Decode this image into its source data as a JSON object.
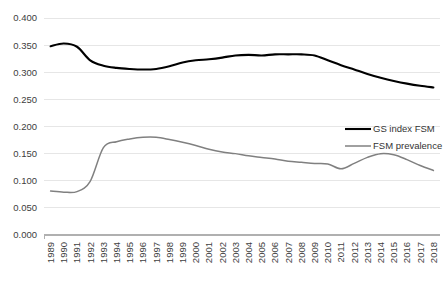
{
  "chart_data": {
    "type": "line",
    "title": "",
    "xlabel": "",
    "ylabel": "",
    "ylim": [
      0.0,
      0.4
    ],
    "ytick_labels": [
      "0.000",
      "0.050",
      "0.100",
      "0.150",
      "0.200",
      "0.250",
      "0.300",
      "0.350",
      "0.400"
    ],
    "ytick_values": [
      0.0,
      0.05,
      0.1,
      0.15,
      0.2,
      0.25,
      0.3,
      0.35,
      0.4
    ],
    "grid": true,
    "legend_position": "center-right",
    "categories": [
      "1989",
      "1990",
      "1991",
      "1992",
      "1993",
      "1994",
      "1995",
      "1996",
      "1997",
      "1998",
      "1999",
      "2000",
      "2001",
      "2002",
      "2003",
      "2004",
      "2005",
      "2006",
      "2007",
      "2008",
      "2009",
      "2010",
      "2011",
      "2012",
      "2013",
      "2014",
      "2015",
      "2016",
      "2017",
      "2018"
    ],
    "series": [
      {
        "name": "GS index FSM",
        "color": "#000000",
        "width": 2.1,
        "values": [
          0.348,
          0.353,
          0.347,
          0.322,
          0.312,
          0.308,
          0.306,
          0.305,
          0.306,
          0.311,
          0.318,
          0.322,
          0.324,
          0.327,
          0.331,
          0.332,
          0.331,
          0.333,
          0.333,
          0.333,
          0.331,
          0.322,
          0.313,
          0.305,
          0.297,
          0.29,
          0.284,
          0.279,
          0.275,
          0.272
        ]
      },
      {
        "name": "FSM prevalence",
        "color": "#808080",
        "width": 1.5,
        "values": [
          0.081,
          0.079,
          0.08,
          0.099,
          0.161,
          0.172,
          0.177,
          0.18,
          0.18,
          0.176,
          0.171,
          0.165,
          0.158,
          0.153,
          0.15,
          0.146,
          0.143,
          0.14,
          0.136,
          0.134,
          0.132,
          0.131,
          0.122,
          0.132,
          0.143,
          0.15,
          0.148,
          0.139,
          0.128,
          0.119
        ]
      }
    ]
  },
  "legend": {
    "items": [
      {
        "label": "GS index FSM"
      },
      {
        "label": "FSM prevalence"
      }
    ]
  }
}
